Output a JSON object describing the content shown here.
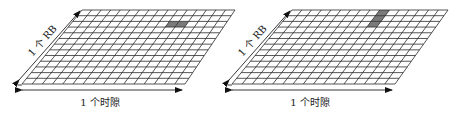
{
  "diagrams": [
    {
      "id": "left",
      "rows": 13,
      "cols": 16,
      "corners": {
        "tl": [
          82,
          10
        ],
        "tr": [
          235,
          10
        ],
        "bl": [
          22,
          84
        ],
        "br": [
          185,
          84
        ]
      },
      "shaded": [
        {
          "row": 2,
          "col": 10
        },
        {
          "row": 2,
          "col": 11
        }
      ],
      "rb_label": "1 个 RB",
      "slot_label": "1 个时隙",
      "slot_arrow": {
        "x1": 22,
        "x2": 182,
        "y": 90
      },
      "slot_label_pos": [
        100,
        106
      ],
      "rb_arrow": {
        "x1": 19,
        "y1": 80,
        "x2": 80,
        "y2": 11
      },
      "rb_label_pos": [
        45,
        43
      ]
    },
    {
      "id": "right",
      "rows": 13,
      "cols": 16,
      "corners": {
        "tl": [
          292,
          10
        ],
        "tr": [
          448,
          10
        ],
        "bl": [
          232,
          84
        ],
        "br": [
          395,
          84
        ]
      },
      "shaded": [
        {
          "row": 0,
          "col": 9
        },
        {
          "row": 1,
          "col": 9
        },
        {
          "row": 2,
          "col": 9
        }
      ],
      "rb_label": "1 个 RB",
      "slot_label": "1 个时隙",
      "slot_arrow": {
        "x1": 232,
        "x2": 392,
        "y": 90
      },
      "slot_label_pos": [
        310,
        106
      ],
      "rb_arrow": {
        "x1": 229,
        "y1": 80,
        "x2": 290,
        "y2": 11
      },
      "rb_label_pos": [
        255,
        43
      ]
    }
  ],
  "colors": {
    "line": "#2a2a2a",
    "shade": "#7a7a7a",
    "background": "#ffffff"
  }
}
